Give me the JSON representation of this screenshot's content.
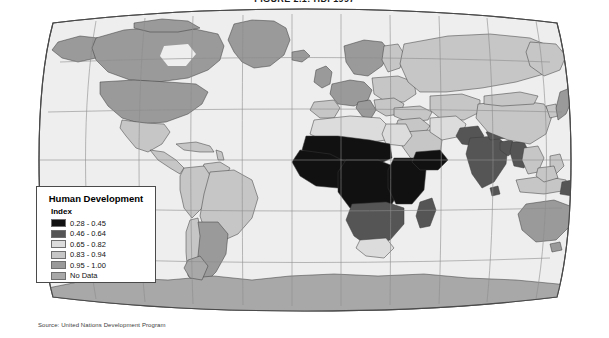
{
  "title": "FIGURE 2.1: HDI 1997",
  "source_note": "Source: United Nations Development Program",
  "legend": {
    "title": "Human Development",
    "subtitle": "Index",
    "entries": [
      {
        "label": "0.28 - 0.45",
        "color": "#111111"
      },
      {
        "label": "0.46 - 0.64",
        "color": "#555555"
      },
      {
        "label": "0.65 - 0.82",
        "color": "#dcdcdc"
      },
      {
        "label": "0.83 - 0.94",
        "color": "#c6c6c6"
      },
      {
        "label": "0.95 - 1.00",
        "color": "#9a9a9a"
      },
      {
        "label": "No Data",
        "color": "#a8a8a8"
      }
    ]
  },
  "map": {
    "projection": "robinson",
    "ocean_color": "#eeeeee",
    "frame_color": "#4a4a4a",
    "graticule_color": "#8d8d8d",
    "border_color": "#3a3a3a",
    "graticule": {
      "parallels": [
        -60,
        -30,
        0,
        30,
        60
      ],
      "meridians": [
        -150,
        -120,
        -90,
        -60,
        -30,
        0,
        30,
        60,
        90,
        120,
        150
      ]
    },
    "regions": [
      {
        "name": "canada",
        "class": "c95"
      },
      {
        "name": "united-states",
        "class": "c95"
      },
      {
        "name": "alaska",
        "class": "c95"
      },
      {
        "name": "greenland",
        "class": "c95"
      },
      {
        "name": "mexico",
        "class": "c83"
      },
      {
        "name": "central-america",
        "class": "c83"
      },
      {
        "name": "caribbean",
        "class": "c83"
      },
      {
        "name": "brazil",
        "class": "c83"
      },
      {
        "name": "argentina",
        "class": "c95"
      },
      {
        "name": "chile",
        "class": "c83"
      },
      {
        "name": "andean-states",
        "class": "c83"
      },
      {
        "name": "guianas",
        "class": "c83"
      },
      {
        "name": "western-europe",
        "class": "c95"
      },
      {
        "name": "eastern-europe",
        "class": "c83"
      },
      {
        "name": "scandinavia",
        "class": "c95"
      },
      {
        "name": "iberia",
        "class": "c83"
      },
      {
        "name": "italy",
        "class": "c95"
      },
      {
        "name": "balkans",
        "class": "c83"
      },
      {
        "name": "russia",
        "class": "c83"
      },
      {
        "name": "central-asia",
        "class": "c83"
      },
      {
        "name": "turkey",
        "class": "c83"
      },
      {
        "name": "middle-east",
        "class": "c83"
      },
      {
        "name": "arabia",
        "class": "c83"
      },
      {
        "name": "iran",
        "class": "c65"
      },
      {
        "name": "north-africa",
        "class": "c65"
      },
      {
        "name": "egypt",
        "class": "c65"
      },
      {
        "name": "sahel",
        "class": "c28"
      },
      {
        "name": "west-africa",
        "class": "c28"
      },
      {
        "name": "central-africa",
        "class": "c28"
      },
      {
        "name": "east-africa",
        "class": "c28"
      },
      {
        "name": "horn-of-africa",
        "class": "c28"
      },
      {
        "name": "southern-africa",
        "class": "c46"
      },
      {
        "name": "south-africa",
        "class": "c65"
      },
      {
        "name": "madagascar",
        "class": "c46"
      },
      {
        "name": "india",
        "class": "c46"
      },
      {
        "name": "pakistan",
        "class": "c46"
      },
      {
        "name": "bangladesh",
        "class": "c46"
      },
      {
        "name": "myanmar",
        "class": "c46"
      },
      {
        "name": "china",
        "class": "c83"
      },
      {
        "name": "mongolia",
        "class": "c83"
      },
      {
        "name": "japan",
        "class": "c95"
      },
      {
        "name": "korea",
        "class": "c83"
      },
      {
        "name": "southeast-asia",
        "class": "c83"
      },
      {
        "name": "indonesia",
        "class": "c83"
      },
      {
        "name": "philippines",
        "class": "c83"
      },
      {
        "name": "papua-new-guinea",
        "class": "c46"
      },
      {
        "name": "australia",
        "class": "c95"
      },
      {
        "name": "new-zealand",
        "class": "c95"
      },
      {
        "name": "antarctica",
        "class": "cnd"
      }
    ]
  }
}
